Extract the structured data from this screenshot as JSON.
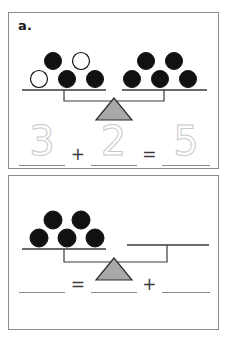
{
  "worksheet": {
    "panels": [
      {
        "id": "a",
        "label": "a.",
        "balance": {
          "left_pan": {
            "total": 5,
            "counters": [
              {
                "fill": "black"
              },
              {
                "fill": "white"
              },
              {
                "fill": "white"
              },
              {
                "fill": "black"
              },
              {
                "fill": "black"
              }
            ]
          },
          "right_pan": {
            "total": 5,
            "counters": [
              {
                "fill": "black"
              },
              {
                "fill": "black"
              },
              {
                "fill": "black"
              },
              {
                "fill": "black"
              },
              {
                "fill": "black"
              }
            ]
          },
          "state": "level",
          "fulcrum_color": "#a8a8a8"
        },
        "equation": {
          "style": "traced",
          "first_term": "3",
          "operator": "+",
          "second_term": "2",
          "equals": "=",
          "sum": "5"
        }
      },
      {
        "id": "b",
        "label": "",
        "balance": {
          "left_pan": {
            "total": 5,
            "counters": [
              {
                "fill": "black"
              },
              {
                "fill": "black"
              },
              {
                "fill": "black"
              },
              {
                "fill": "black"
              },
              {
                "fill": "black"
              }
            ]
          },
          "right_pan": {
            "total": 0,
            "counters": []
          },
          "state": "left-heavy",
          "fulcrum_color": "#a8a8a8"
        },
        "equation": {
          "style": "blank",
          "first_term": "",
          "operator": "+",
          "second_term": "",
          "equals": "=",
          "sum": ""
        }
      }
    ]
  },
  "colors": {
    "counter_filled": "#111111",
    "counter_empty": "#ffffff",
    "counter_stroke": "#111111",
    "panel_border": "#8c8c8c",
    "beam": "#4a4a4a",
    "trace_gray": "#c9c9c9",
    "blank_line": "#8a8a8a"
  }
}
